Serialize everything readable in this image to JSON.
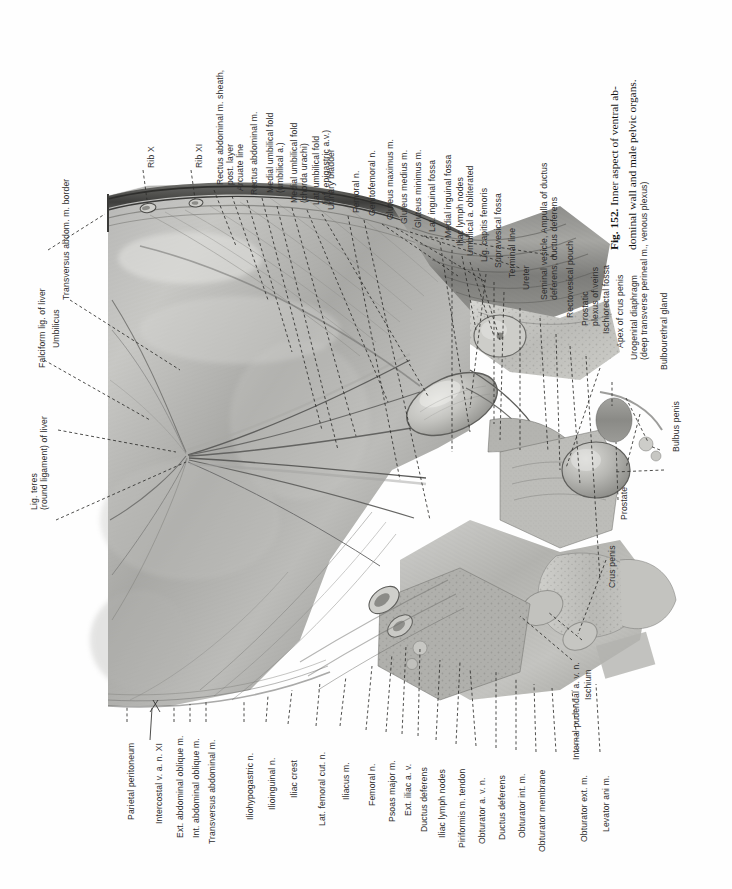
{
  "figure": {
    "number": "Fig. 152.",
    "caption_line1": "Inner aspect of ventral ab-",
    "caption_line2": "dominal wall and male pelvic organs.",
    "full_caption": "Fig. 152. Inner aspect of ventral abdominal wall and male pelvic organs.",
    "plate_type": "anatomical-illustration",
    "orientation": "rotated-90-ccw",
    "ink_color": "#2d2d2d",
    "paper_color": "#fefefe"
  },
  "labels_top": [
    {
      "id": "rib-x",
      "text": "Rib X"
    },
    {
      "id": "rib-xi",
      "text": "Rib XI"
    },
    {
      "id": "rectus-sheath",
      "text": "Rectus abdominal m. sheath,\npost. layer"
    },
    {
      "id": "arcuate-line",
      "text": "Arcuate line"
    },
    {
      "id": "rectus-abdominal",
      "text": "Rectus abdominal m."
    },
    {
      "id": "medial-umbilical-fold-a",
      "text": "Medial umbilical fold\n(umbilical a.)"
    },
    {
      "id": "medial-umbilical-fold-chorda",
      "text": "Medial umbilical fold\n(chorda urachi)"
    },
    {
      "id": "lat-umbilical-fold",
      "text": "Lat. umbilical fold\n(inf. epigastric a.v.)"
    },
    {
      "id": "urinary-bladder",
      "text": "Urinary bladder"
    },
    {
      "id": "femoral-n-top",
      "text": "Femoral n."
    },
    {
      "id": "genitofemoral-n",
      "text": "Genitofemoral n."
    },
    {
      "id": "gluteus-maximus",
      "text": "Gluteus maximus m."
    },
    {
      "id": "gluteus-medius",
      "text": "Gluteus medius m."
    },
    {
      "id": "gluteus-minimus",
      "text": "Gluteus minimus m."
    },
    {
      "id": "lat-inguinal-fossa",
      "text": "Lat. inguinal fossa"
    },
    {
      "id": "medial-inguinal-fossa",
      "text": "Medial inguinal fossa"
    },
    {
      "id": "iliac-lymph-nodes-top",
      "text": "Iliac lymph nodes"
    },
    {
      "id": "umbilical-a-obliterated",
      "text": "Umbilical a. obliterated"
    },
    {
      "id": "lig-capitis-femoris",
      "text": "Lig. capitis femoris"
    },
    {
      "id": "supravesical-fossa",
      "text": "Supravesical fossa"
    },
    {
      "id": "terminal-line",
      "text": "Terminal line"
    },
    {
      "id": "ureter",
      "text": "Ureter"
    },
    {
      "id": "seminal-vesicle",
      "text": "Seminal vesicle, Ampulla of ductus\ndeferens, ductus deferens"
    },
    {
      "id": "rectovesical-pouch",
      "text": "Rectovesical pouch"
    },
    {
      "id": "prostatic-plexus",
      "text": "Prostatic\nplexus of veins"
    },
    {
      "id": "ischiorectal-fossa",
      "text": "Ischiorectal fossa"
    },
    {
      "id": "apex-crus-penis",
      "text": "Apex of crus penis"
    },
    {
      "id": "urogenital-diaphragm",
      "text": "Urogenital diaphragm\n(deep transverse perineal m., venous plexus)"
    },
    {
      "id": "bulbourethral-gland",
      "text": "Bulbourethral gland"
    },
    {
      "id": "bulbus-penis",
      "text": "Bulbus penis"
    }
  ],
  "labels_left": [
    {
      "id": "transversus-border",
      "text": "Transversus abdom. m. border"
    },
    {
      "id": "umbilicus",
      "text": "Umbilicus"
    },
    {
      "id": "falciform-lig",
      "text": "Falciform lig. of liver"
    },
    {
      "id": "lig-teres",
      "text": "Lig. teres\n(round ligament) of liver"
    }
  ],
  "labels_bottom": [
    {
      "id": "parietal-peritoneum",
      "text": "Parietal peritoneum"
    },
    {
      "id": "intercostal-xi",
      "text": "Intercostal v. a. n. XI"
    },
    {
      "id": "ext-abdominal-oblique",
      "text": "Ext. abdominal oblique m."
    },
    {
      "id": "int-abdominal-oblique",
      "text": "Int. abdominal oblique m."
    },
    {
      "id": "transversus-abdominal",
      "text": "Transversus abdominal m."
    },
    {
      "id": "iliohypogastric-n",
      "text": "Iliohypogastric n."
    },
    {
      "id": "ilioinguinal-n",
      "text": "Ilioinguinal n."
    },
    {
      "id": "iliac-crest",
      "text": "Iliac crest"
    },
    {
      "id": "lat-femoral-cut-n",
      "text": "Lat. femoral cut. n."
    },
    {
      "id": "iliacus-m",
      "text": "Iliacus m."
    },
    {
      "id": "femoral-n-bottom",
      "text": "Femoral n."
    },
    {
      "id": "psoas-major",
      "text": "Psoas major m."
    },
    {
      "id": "ext-iliac-av",
      "text": "Ext. iliac a. v."
    },
    {
      "id": "ductus-deferens-1",
      "text": "Ductus deferens"
    },
    {
      "id": "iliac-lymph-nodes-bottom",
      "text": "Iliac lymph nodes"
    },
    {
      "id": "piriformis-tendon",
      "text": "Piriformis m. tendon"
    },
    {
      "id": "obturator-avn",
      "text": "Obturator a. v. n."
    },
    {
      "id": "ductus-deferens-2",
      "text": "Ductus deferens"
    },
    {
      "id": "obturator-int",
      "text": "Obturator int. m."
    },
    {
      "id": "obturator-membrane",
      "text": "Obturator membrane"
    },
    {
      "id": "obturator-ext",
      "text": "Obturator ext. m."
    },
    {
      "id": "levator-ani",
      "text": "Levator ani m."
    }
  ],
  "labels_right": [
    {
      "id": "prostate",
      "text": "Prostate"
    },
    {
      "id": "crus-penis",
      "text": "Crus penis"
    },
    {
      "id": "ischium",
      "text": "Ischium"
    },
    {
      "id": "internal-pudendal",
      "text": "Internal pudendal a. v. n."
    }
  ]
}
